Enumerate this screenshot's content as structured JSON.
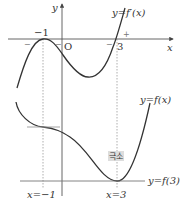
{
  "diagram": {
    "top_graph": {
      "curve_label": "y=f′(x)",
      "y_axis_label": "y",
      "x_axis_label": "x",
      "origin_label": "O",
      "point_labels": [
        "−1",
        "3"
      ],
      "sign_labels": [
        "−",
        "−",
        "−",
        "+"
      ]
    },
    "bottom_graph": {
      "curve_label": "y=f(x)",
      "min_label": "극소",
      "horizontal_line_label": "y=f(3)",
      "vline_labels": [
        "x=−1",
        "x=3"
      ]
    },
    "colors": {
      "curve": "#333333",
      "axis": "#555555",
      "guide": "#999999",
      "badge": "#dddddd"
    }
  }
}
